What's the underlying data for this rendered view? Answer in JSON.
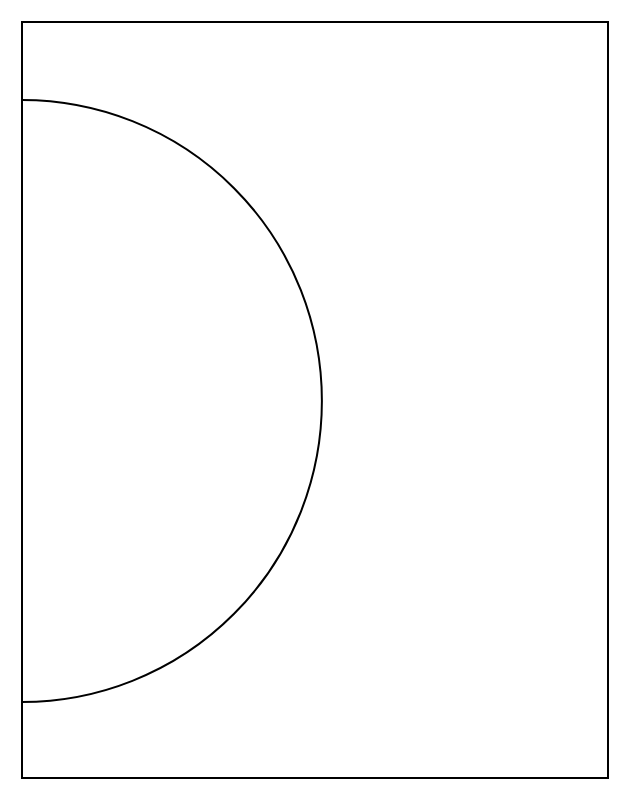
{
  "page": {
    "width": 630,
    "height": 798,
    "background_color": "#ffffff"
  },
  "caption": {
    "text": "ScreenShot  (    )",
    "color": "#d8d8dc",
    "clipped": "true"
  },
  "figure": {
    "title": "",
    "stroke_color": "#000000",
    "fill_color": "#ffffff",
    "stroke_width": 2,
    "border": {
      "name": "page-border-rectangle",
      "left": 22,
      "top": 22,
      "right": 608,
      "bottom": 778,
      "width": 586,
      "height": 756
    },
    "arc": {
      "name": "semicircular-arc",
      "shape": "semicircle",
      "start_point": [
        22,
        100
      ],
      "end_point": [
        22,
        702
      ],
      "apex_point": [
        321,
        401
      ],
      "center": [
        22,
        401
      ],
      "radius": 301,
      "bulge_direction": "right",
      "path": "M 22 100 A 300 301 0 0 1 22 702"
    }
  }
}
